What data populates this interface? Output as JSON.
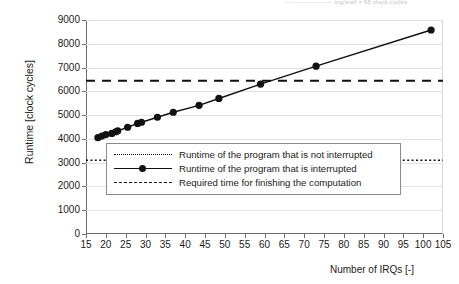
{
  "top_fragment": "— — — — — — ing/stall = 66 clock cycles",
  "axes": {
    "ylabel": "Runtime [clock cycles]",
    "xlabel": "Number of IRQs [-]",
    "yticks": [
      0,
      1000,
      2000,
      3000,
      4000,
      5000,
      6000,
      7000,
      8000,
      9000
    ],
    "xticks": [
      15,
      20,
      25,
      30,
      35,
      40,
      45,
      50,
      55,
      60,
      65,
      70,
      75,
      80,
      85,
      90,
      95,
      100,
      105
    ]
  },
  "legend": {
    "items": [
      {
        "key": "dotted-line",
        "label": "Runtime of the program that is not interrupted"
      },
      {
        "key": "solid-line-with-marker",
        "label": "Runtime of the program that is interrupted"
      },
      {
        "key": "dashed-line",
        "label": "Required time for finishing the computation"
      }
    ]
  },
  "chart_data": {
    "type": "line",
    "title": "",
    "xlabel": "Number of IRQs [-]",
    "ylabel": "Runtime [clock cycles]",
    "xlim": [
      15,
      105
    ],
    "ylim": [
      0,
      9000
    ],
    "grid": true,
    "legend_position": "inside-lower-left",
    "series": [
      {
        "name": "Runtime of the program that is not interrupted",
        "style": "dotted",
        "marker": "none",
        "constant_value": 3100,
        "x": [
          15,
          105
        ],
        "y": [
          3100,
          3100
        ]
      },
      {
        "name": "Runtime of the program that is interrupted",
        "style": "solid",
        "marker": "filled-circle",
        "x": [
          18,
          19,
          20,
          21.5,
          22.5,
          23,
          25.5,
          28,
          29,
          33,
          37,
          43.5,
          48.5,
          59,
          73,
          102
        ],
        "y": [
          4050,
          4120,
          4180,
          4230,
          4300,
          4340,
          4490,
          4650,
          4700,
          4910,
          5120,
          5410,
          5700,
          6300,
          7060,
          8580
        ]
      },
      {
        "name": "Required time for finishing the computation",
        "style": "dashed",
        "marker": "none",
        "constant_value": 6450,
        "x": [
          15,
          105
        ],
        "y": [
          6450,
          6450
        ]
      }
    ]
  }
}
